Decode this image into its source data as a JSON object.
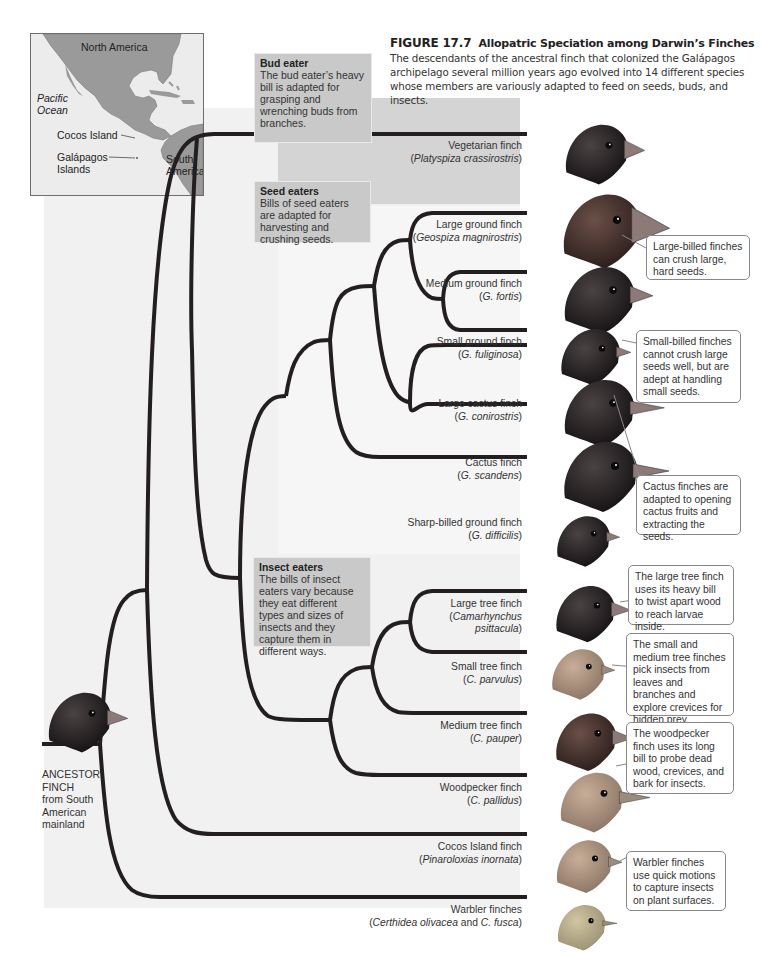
{
  "figure": {
    "number": "FIGURE 17.7",
    "title": "Allopatric Speciation among Darwin’s Finches",
    "description": "The descendants of the ancestral finch that colonized the Galápagos archipelago several million years ago evolved into 14 different species whose members are variously adapted to feed on seeds, buds, and insects."
  },
  "map": {
    "labels": {
      "north_america": "North America",
      "pacific_ocean_1": "Pacific",
      "pacific_ocean_2": "Ocean",
      "cocos_island": "Cocos Island",
      "galapagos_1": "Galápagos",
      "galapagos_2": "Islands",
      "south_america_1": "South",
      "south_america_2": "America"
    }
  },
  "groups": {
    "bud_eater": {
      "title": "Bud eater",
      "text": "The bud eater’s heavy bill is adapted for grasping and wrenching buds from branches."
    },
    "seed_eaters": {
      "title": "Seed eaters",
      "text": "Bills of seed eaters are adapted for harvesting and crushing seeds."
    },
    "insect_eaters": {
      "title": "Insect eaters",
      "text": "The bills of insect eaters vary because they eat different types and sizes of insects and they capture them in different ways."
    }
  },
  "ancestor": {
    "line1": "ANCESTOR",
    "line2": "FINCH",
    "line3": "from South",
    "line4": "American",
    "line5": "mainland"
  },
  "species": [
    {
      "common": "Vegetarian finch",
      "sci_open": "(",
      "sci": "Platyspiza crassirostris",
      "sci_close": ")"
    },
    {
      "common": "Large ground finch",
      "sci_open": "(",
      "sci": "Geospiza magnirostris",
      "sci_close": ")"
    },
    {
      "common": "Medium ground finch",
      "sci_open": "(",
      "sci": "G. fortis",
      "sci_close": ")"
    },
    {
      "common": "Small ground finch",
      "sci_open": "(",
      "sci": "G. fuliginosa",
      "sci_close": ")"
    },
    {
      "common": "Large cactus finch",
      "sci_open": "(",
      "sci": "G. conirostris",
      "sci_close": ")"
    },
    {
      "common": "Cactus finch",
      "sci_open": "(",
      "sci": "G. scandens",
      "sci_close": ")"
    },
    {
      "common": "Sharp-billed ground finch",
      "sci_open": "(",
      "sci": "G. difficilis",
      "sci_close": ")"
    },
    {
      "common": "Large tree finch",
      "sci_open": "(",
      "sci": "Camarhynchus",
      "sci2": "psittacula",
      "sci_close": ")"
    },
    {
      "common": "Small tree finch",
      "sci_open": "(",
      "sci": "C. parvulus",
      "sci_close": ")"
    },
    {
      "common": "Medium tree finch",
      "sci_open": "(",
      "sci": "C. pauper",
      "sci_close": ")"
    },
    {
      "common": "Woodpecker finch",
      "sci_open": "(",
      "sci": "C. pallidus",
      "sci_close": ")"
    },
    {
      "common": "Cocos Island finch",
      "sci_open": "(",
      "sci": "Pinaroloxias inornata",
      "sci_close": ")"
    },
    {
      "common": "Warbler finches",
      "sci_open": "(",
      "sci": "Certhidea olivacea",
      "sci_mid": " and ",
      "sci2": "C. fusca",
      "sci_close": ")"
    }
  ],
  "callouts": {
    "large_billed": "Large-billed finches can crush large, hard seeds.",
    "small_billed": "Small-billed finches cannot crush large seeds well, but are adept at handling small seeds.",
    "cactus": "Cactus finches are adapted to opening cactus fruits and extracting the seeds.",
    "large_tree": "The large tree finch uses its heavy bill to twist apart wood to reach larvae inside.",
    "small_medium_tree": "The small and medium tree finches pick insects from leaves and branches and explore crevices for hidden prey.",
    "woodpecker": "The woodpecker finch uses its long bill to probe dead wood, crevices, and bark for insects.",
    "warbler": "Warbler finches use quick motions to capture insects on plant surfaces."
  },
  "colors": {
    "branch": "#231f20",
    "panel_main": "#f1f1f1",
    "panel_bud": "#d4d4d4",
    "group_box": "#c9c9c9",
    "map_land": "#9a9a9a",
    "map_sea": "#ececec"
  }
}
